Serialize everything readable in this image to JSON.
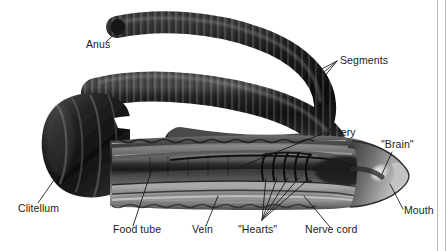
{
  "figure": {
    "style": "grayscale photographic illustration with leader-line callouts",
    "background_color": "#ffffff",
    "text_color": "#1a1a1a",
    "leader_line_color": "#141414",
    "frame_line_color": "#b9b9b9",
    "width": 447,
    "height": 251
  },
  "labels": {
    "anus": "Anus",
    "segments": "Segments",
    "artery": "Artery",
    "brain": "\"Brain\"",
    "mouth": "Mouth",
    "nerve_cord": "Nerve cord",
    "hearts": "\"Hearts\"",
    "vein": "Vein",
    "food_tube": "Food tube",
    "clitellum": "Clitellum"
  },
  "callouts": [
    {
      "id": "anus",
      "label": "Anus",
      "text_x": 86,
      "text_y": 48,
      "anchor": "start",
      "target_x": 118,
      "target_y": 26
    },
    {
      "id": "segments",
      "label": "Segments",
      "text_x": 340,
      "text_y": 64,
      "anchor": "start",
      "target_x": 318,
      "target_y": 78
    },
    {
      "id": "artery",
      "label": "Artery",
      "text_x": 327,
      "text_y": 136,
      "anchor": "start",
      "target_x": 240,
      "target_y": 168
    },
    {
      "id": "brain",
      "label": "\"Brain\"",
      "text_x": 381,
      "text_y": 148,
      "anchor": "start",
      "target_x": 404,
      "target_y": 175
    },
    {
      "id": "mouth",
      "label": "Mouth",
      "text_x": 404,
      "text_y": 214,
      "anchor": "start",
      "target_x": 388,
      "target_y": 183
    },
    {
      "id": "nerve_cord",
      "label": "Nerve cord",
      "text_x": 305,
      "text_y": 233,
      "anchor": "start",
      "target_x": 303,
      "target_y": 196
    },
    {
      "id": "hearts",
      "label": "\"Hearts\"",
      "text_x": 240,
      "text_y": 233,
      "anchor": "start",
      "target_x": 262,
      "target_y": 213
    },
    {
      "id": "vein",
      "label": "Vein",
      "text_x": 192,
      "text_y": 233,
      "anchor": "start",
      "target_x": 215,
      "target_y": 198
    },
    {
      "id": "food_tube",
      "label": "Food tube",
      "text_x": 113,
      "text_y": 233,
      "anchor": "start",
      "target_x": 152,
      "target_y": 168
    },
    {
      "id": "clitellum",
      "label": "Clitellum",
      "text_x": 18,
      "text_y": 212,
      "anchor": "start",
      "target_x": 52,
      "target_y": 181
    }
  ],
  "anatomy_parts": [
    {
      "name": "Anus",
      "region": "posterior tip of tail"
    },
    {
      "name": "Segments",
      "region": "repeating rings along body wall"
    },
    {
      "name": "Clitellum",
      "region": "thickened band near anterior third"
    },
    {
      "name": "Food tube",
      "region": "digestive tract running length of body"
    },
    {
      "name": "Vein",
      "region": "ventral blood vessel"
    },
    {
      "name": "\"Hearts\"",
      "region": "five aortic arches encircling the food tube",
      "count": 5
    },
    {
      "name": "Artery",
      "region": "dorsal blood vessel"
    },
    {
      "name": "Nerve cord",
      "region": "ventral nerve cord"
    },
    {
      "name": "\"Brain\"",
      "region": "cerebral ganglion behind the mouth"
    },
    {
      "name": "Mouth",
      "region": "anterior opening at head"
    }
  ]
}
